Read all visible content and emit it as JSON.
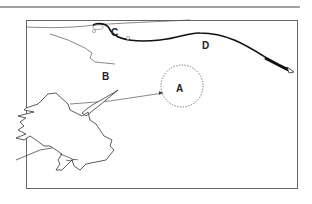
{
  "figure": {
    "labels": {
      "a": "A",
      "b": "B",
      "c": "C",
      "d": "D"
    }
  },
  "colors": {
    "ink": "#1a1a1a",
    "frame": "#555555",
    "dotted": "#666666"
  }
}
